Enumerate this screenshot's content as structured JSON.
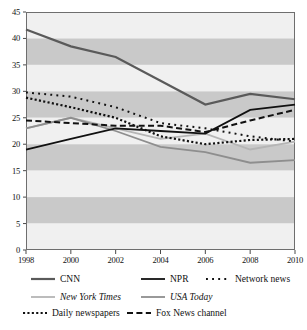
{
  "chart_data": {
    "type": "line",
    "title": "",
    "xlabel": "",
    "ylabel": "",
    "x": [
      1998,
      2000,
      2002,
      2004,
      2006,
      2008,
      2010
    ],
    "xticklabels": [
      "1998",
      "2000",
      "2002",
      "2004",
      "2006",
      "2008",
      "2010"
    ],
    "yticklabels": [
      "0",
      "5",
      "10",
      "15",
      "20",
      "25",
      "30",
      "35",
      "40",
      "45"
    ],
    "ylim": [
      0,
      45
    ],
    "ytick_step": 5,
    "grid": "horizontal-alternating-bands",
    "legend_position": "below",
    "series": [
      {
        "name": "CNN",
        "style": "solid",
        "color": "#5a5a5a",
        "width": 2.2,
        "values": [
          41.7,
          38.5,
          36.5,
          32.0,
          27.5,
          29.5,
          28.5
        ]
      },
      {
        "name": "NPR",
        "style": "solid",
        "color": "#111111",
        "width": 1.8,
        "values": [
          19.0,
          21.0,
          23.0,
          22.5,
          22.0,
          26.5,
          27.5
        ]
      },
      {
        "name": "Network news",
        "style": "sparse-dotted",
        "color": "#111111",
        "width": 2.0,
        "values": [
          29.8,
          29.0,
          27.0,
          24.0,
          23.0,
          21.5,
          20.5
        ]
      },
      {
        "name": "New York Times",
        "style": "solid",
        "color": "#b5b5b5",
        "width": 1.8,
        "values": [
          23.0,
          25.0,
          23.0,
          21.0,
          22.0,
          19.0,
          20.5
        ]
      },
      {
        "name": "USA Today",
        "style": "solid",
        "color": "#8e8e8e",
        "width": 1.8,
        "values": [
          23.0,
          25.0,
          22.5,
          19.5,
          18.5,
          16.5,
          17.0
        ]
      },
      {
        "name": "Daily newspapers",
        "style": "dense-dotted",
        "color": "#111111",
        "width": 2.2,
        "values": [
          28.8,
          27.0,
          25.0,
          21.5,
          20.0,
          20.8,
          21.0
        ]
      },
      {
        "name": "Fox News channel",
        "style": "dashed",
        "color": "#111111",
        "width": 2.0,
        "values": [
          24.5,
          24.0,
          23.5,
          23.5,
          22.3,
          24.5,
          26.5
        ]
      }
    ]
  },
  "legend": {
    "rows": [
      [
        {
          "label": "CNN",
          "key": "cnn",
          "italic": false
        },
        {
          "label": "NPR",
          "key": "npr",
          "italic": false
        },
        {
          "label": "Network news",
          "key": "network-news",
          "italic": false
        }
      ],
      [
        {
          "label": "New York Times",
          "key": "new-york-times",
          "italic": true
        },
        {
          "label": "USA Today",
          "key": "usa-today",
          "italic": true
        }
      ],
      [
        {
          "label": "Daily newspapers",
          "key": "daily-newspapers",
          "italic": false
        },
        {
          "label": "Fox News channel",
          "key": "fox-news-channel",
          "italic": false
        }
      ]
    ]
  },
  "axis": {
    "y_ticks": [
      "45",
      "40",
      "35",
      "30",
      "25",
      "20",
      "15",
      "10",
      "5",
      "0"
    ],
    "x_ticks": [
      "1998",
      "2000",
      "2002",
      "2004",
      "2006",
      "2008",
      "2010"
    ]
  },
  "colors": {
    "band_light": "#f0f0f0",
    "band_dark": "#c9c9c9",
    "plot_border": "#6e6e6e",
    "cnn": "#5a5a5a",
    "npr": "#111111",
    "network_news": "#111111",
    "new_york_times": "#b5b5b5",
    "usa_today": "#8e8e8e",
    "daily_newspapers": "#111111",
    "fox_news_channel": "#111111"
  }
}
